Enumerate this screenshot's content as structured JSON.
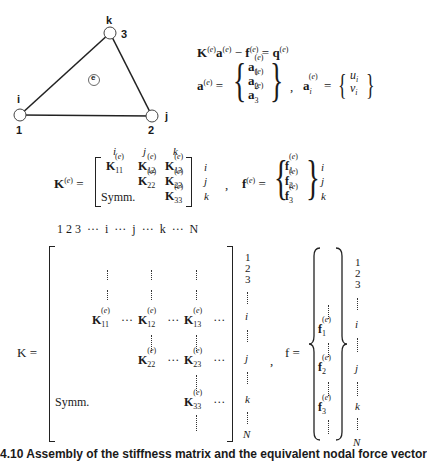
{
  "figure": {
    "triangle": {
      "nodes": [
        {
          "letter": "i",
          "number": "1"
        },
        {
          "letter": "j",
          "number": "2"
        },
        {
          "letter": "k",
          "number": "3"
        }
      ],
      "element_label": "e"
    },
    "equations": {
      "equilibrium": "K(e) a(e) − f(e) = q(e)",
      "a_e_lhs": "a(e) =",
      "a_e_entries": [
        "a1(e)",
        "a2(e)",
        "a3(e)"
      ],
      "separator": ",",
      "ai_lhs": "ai(e) =",
      "ai_entries": [
        "ui",
        "vi"
      ]
    },
    "element_matrix": {
      "lhs": "K(e) =",
      "col_labels": [
        "i",
        "j",
        "k"
      ],
      "row_labels": [
        "i",
        "j",
        "k"
      ],
      "entries": [
        "K11(e)",
        "K12(e)",
        "K13(e)",
        "K22(e)",
        "K23(e)",
        "K33(e)"
      ],
      "symm": "Symm.",
      "f_lhs": "f(e) =",
      "f_entries": [
        "f1(e)",
        "f2(e)",
        "f3(e)"
      ]
    },
    "global_matrix": {
      "col_header": "1 2 3  ···  i  ···  j  ···  k  ···  N",
      "lhs": "K =",
      "entries": [
        "K11(e)",
        "K12(e)",
        "K13(e)",
        "K22(e)",
        "K23(e)",
        "K33(e)"
      ],
      "symm": "Symm.",
      "row_labels": [
        "1",
        "2",
        "3",
        "i",
        "j",
        "k",
        "N"
      ],
      "f_lhs": "f =",
      "f_entries": [
        "f1(e)",
        "f2(e)",
        "f3(e)"
      ]
    },
    "caption": "4.10 Assembly of the stiffness matrix and the equivalent nodal force vector"
  }
}
